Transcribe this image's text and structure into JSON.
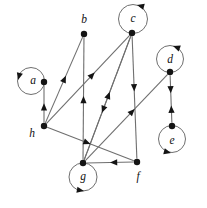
{
  "figure": {
    "background_color": "#ffffff",
    "node_color": "#141414",
    "edge_color": "#6f6f6f",
    "arrow_color": "#141414",
    "width": 207,
    "height": 208
  },
  "nodes": [
    {
      "id": "a",
      "label": "a",
      "x": 44,
      "y": 82,
      "label_x": 33,
      "label_y": 81
    },
    {
      "id": "b",
      "label": "b",
      "x": 84,
      "y": 34,
      "label_x": 84,
      "label_y": 20
    },
    {
      "id": "c",
      "label": "c",
      "x": 132,
      "y": 33,
      "label_x": 133,
      "label_y": 19
    },
    {
      "id": "d",
      "label": "d",
      "x": 170,
      "y": 72,
      "label_x": 170,
      "label_y": 60
    },
    {
      "id": "e",
      "label": "e",
      "x": 172,
      "y": 126,
      "label_x": 172,
      "label_y": 141
    },
    {
      "id": "f",
      "label": "f",
      "x": 137,
      "y": 162,
      "label_x": 138,
      "label_y": 177
    },
    {
      "id": "g",
      "label": "g",
      "x": 83,
      "y": 163,
      "label_x": 83,
      "label_y": 177
    },
    {
      "id": "h",
      "label": "h",
      "x": 44,
      "y": 126,
      "label_x": 32,
      "label_y": 134
    }
  ],
  "self_loops": [
    {
      "node": "a",
      "side": "left",
      "cx": 31,
      "cy": 81,
      "r": 13.5,
      "arrow_x": 18,
      "arrow_y": 80,
      "arrow_angle": 105
    },
    {
      "node": "c",
      "side": "top",
      "cx": 133,
      "cy": 19,
      "r": 14.5,
      "arrow_x": 137,
      "arrow_y": 5,
      "arrow_angle": 195
    },
    {
      "node": "d",
      "side": "top",
      "cx": 170,
      "cy": 59,
      "r": 13.5,
      "arrow_x": 173,
      "arrow_y": 46,
      "arrow_angle": 200
    },
    {
      "node": "e",
      "side": "bottom",
      "cx": 172,
      "cy": 139,
      "r": 13.5,
      "arrow_x": 171,
      "arrow_y": 153,
      "arrow_angle": 15
    },
    {
      "node": "g",
      "side": "bottom",
      "cx": 83,
      "cy": 177,
      "r": 14.0,
      "arrow_x": 84,
      "arrow_y": 191,
      "arrow_angle": 10
    }
  ],
  "edges": [
    {
      "id": "h-a",
      "from": "h",
      "to": "a",
      "direction": "one-way",
      "arrow_t": 0.52
    },
    {
      "id": "h-b",
      "from": "h",
      "to": "b",
      "direction": "one-way",
      "arrow_t": 0.55
    },
    {
      "id": "h-c",
      "from": "h",
      "to": "c",
      "direction": "one-way",
      "arrow_t": 0.58
    },
    {
      "id": "h-f",
      "from": "h",
      "to": "f",
      "direction": "one-way",
      "arrow_t": 0.5
    },
    {
      "id": "g-b",
      "from": "g",
      "to": "b",
      "direction": "one-way",
      "arrow_t": 0.52
    },
    {
      "id": "g-c",
      "from": "g",
      "to": "c",
      "direction": "one-way",
      "arrow_t": 0.55
    },
    {
      "id": "g-d",
      "from": "g",
      "to": "d",
      "direction": "one-way",
      "arrow_t": 0.6
    },
    {
      "id": "c-g",
      "from": "c",
      "to": "g",
      "direction": "one-way",
      "arrow_t": 0.62
    },
    {
      "id": "c-f",
      "from": "c",
      "to": "f",
      "direction": "one-way",
      "arrow_t": 0.45
    },
    {
      "id": "f-g",
      "from": "f",
      "to": "g",
      "direction": "one-way",
      "arrow_t": 0.5
    },
    {
      "id": "d-e",
      "from": "d",
      "to": "e",
      "direction": "bidirectional",
      "arrow_t": 0.38,
      "arrow_t_back": 0.64
    }
  ],
  "adjacency_summary": {
    "a": [],
    "b": [],
    "c": [
      "g",
      "f",
      "c"
    ],
    "d": [
      "e",
      "d"
    ],
    "e": [
      "d",
      "e"
    ],
    "f": [
      "g"
    ],
    "g": [
      "b",
      "c",
      "d",
      "g"
    ],
    "h": [
      "a",
      "b",
      "c",
      "f"
    ]
  }
}
